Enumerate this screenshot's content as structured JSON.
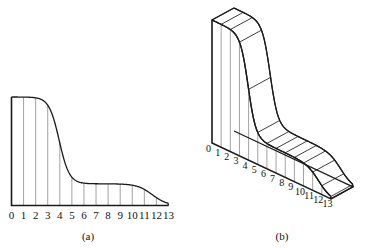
{
  "figure": {
    "panels": [
      {
        "id": "panel-a",
        "caption": "(a)",
        "type": "2d-area-with-ordinates",
        "tick_labels": [
          "0",
          "1",
          "2",
          "3",
          "4",
          "5",
          "6",
          "7",
          "8",
          "9",
          "10",
          "11",
          "12",
          "13"
        ]
      },
      {
        "id": "panel-b",
        "caption": "(b)",
        "type": "3d-isometric-solid-with-ordinates",
        "tick_labels": [
          "0",
          "1",
          "2",
          "3",
          "4",
          "5",
          "6",
          "7",
          "8",
          "9",
          "10",
          "11",
          "12",
          "13"
        ]
      }
    ],
    "colors": {
      "outline": "#1a1a1a",
      "gridline": "#8a8a8a",
      "background": "#ffffff",
      "text": "#111111"
    }
  },
  "chart_data": {
    "type": "area",
    "title": "",
    "xlabel": "",
    "ylabel": "",
    "xlim": [
      0,
      13
    ],
    "ylim": [
      0,
      1
    ],
    "grid": false,
    "legend": null,
    "categories": [
      "0",
      "1",
      "2",
      "3",
      "4",
      "5",
      "6",
      "7",
      "8",
      "9",
      "10",
      "11",
      "12",
      "13"
    ],
    "x": [
      0,
      1,
      2,
      3,
      4,
      5,
      6,
      7,
      8,
      9,
      10,
      11,
      12,
      13
    ],
    "values": [
      1.0,
      1.0,
      0.98,
      0.93,
      0.55,
      0.27,
      0.21,
      0.2,
      0.2,
      0.2,
      0.19,
      0.15,
      0.09,
      0.0
    ],
    "series": [
      {
        "name": "ordinate heights",
        "values": [
          1.0,
          1.0,
          0.98,
          0.93,
          0.55,
          0.27,
          0.21,
          0.2,
          0.2,
          0.2,
          0.19,
          0.15,
          0.09,
          0.0
        ]
      }
    ],
    "annotations": [
      "(a)",
      "(b)"
    ]
  }
}
